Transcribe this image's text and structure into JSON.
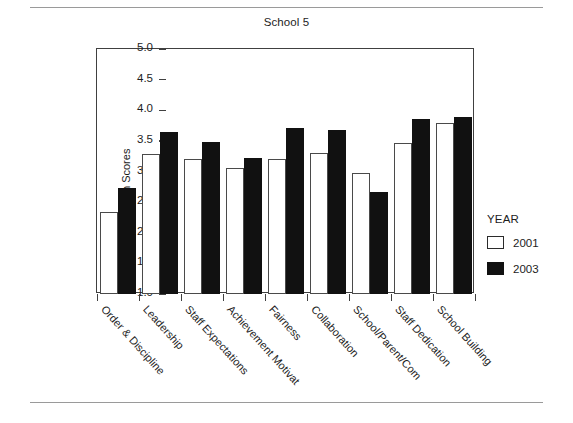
{
  "chart_data": {
    "type": "bar",
    "title": "School 5",
    "xlabel": "",
    "ylabel": "Mean Scores",
    "ylim": [
      1.0,
      5.0
    ],
    "ytick_labels": [
      "5.0",
      "4.5",
      "4.0",
      "3.5",
      "3.0",
      "2.5",
      "2.0",
      "1.5",
      "1.0"
    ],
    "ytick_values": [
      5.0,
      4.5,
      4.0,
      3.5,
      3.0,
      2.5,
      2.0,
      1.5,
      1.0
    ],
    "grid": false,
    "legend_position": "right",
    "legend_title": "YEAR",
    "categories": [
      "Order & Discipline",
      "Leadership",
      "Staff Expectations",
      "Achievement Motivat",
      "Fairness",
      "Collaboration",
      "School/Parent/Com",
      "Staff Dedication",
      "School Building"
    ],
    "series": [
      {
        "name": "2001",
        "color": "#ffffff",
        "edge_color": "#4a4a4a",
        "values": [
          2.34,
          3.29,
          3.2,
          3.06,
          3.21,
          3.3,
          2.98,
          3.46,
          3.8
        ]
      },
      {
        "name": "2003",
        "color": "#111111",
        "edge_color": "#111111",
        "values": [
          2.73,
          3.64,
          3.48,
          3.22,
          3.71,
          3.67,
          2.66,
          3.85,
          3.89
        ]
      }
    ]
  },
  "figure": {
    "title": "School 5",
    "y_axis_title": "Mean Scores"
  }
}
